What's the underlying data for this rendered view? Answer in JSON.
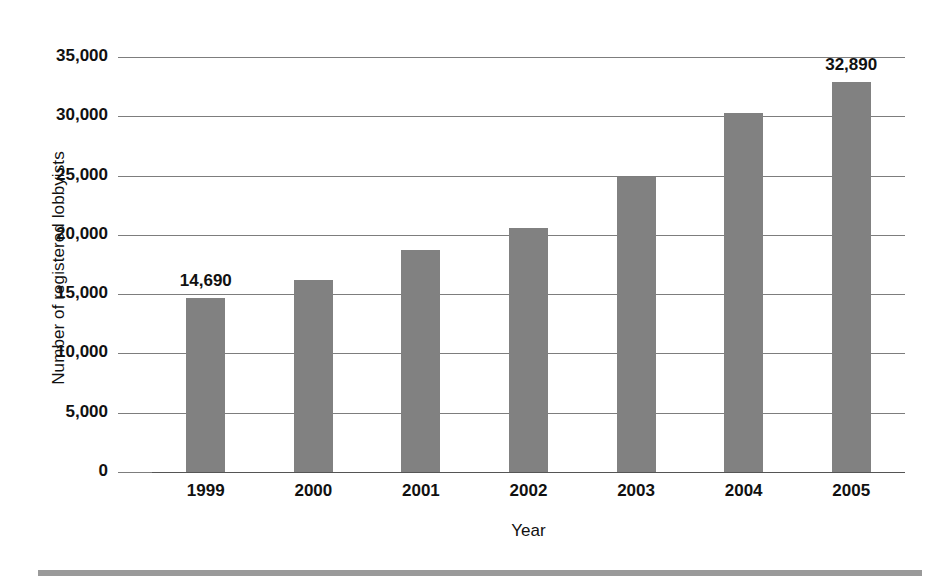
{
  "chart_data": {
    "type": "bar",
    "title": "",
    "xlabel": "Year",
    "ylabel": "Number of registered lobbyists",
    "categories": [
      "1999",
      "2000",
      "2001",
      "2002",
      "2003",
      "2004",
      "2005"
    ],
    "values": [
      14690,
      16200,
      18700,
      20600,
      24900,
      30250,
      32890
    ],
    "ylim": [
      0,
      35000
    ],
    "ytick_values": [
      0,
      5000,
      10000,
      15000,
      20000,
      25000,
      30000,
      35000
    ],
    "ytick_labels": [
      "0",
      "5,000",
      "10,000",
      "15,000",
      "20,000",
      "25,000",
      "30,000",
      "35,000"
    ],
    "grid": true,
    "legend": false,
    "bar_color": "#818181",
    "gridline_color": "#7d7d7d",
    "text_color": "#111111",
    "point_labels": [
      {
        "category": "1999",
        "text": "14,690"
      },
      {
        "category": "2005",
        "text": "32,890"
      }
    ]
  }
}
